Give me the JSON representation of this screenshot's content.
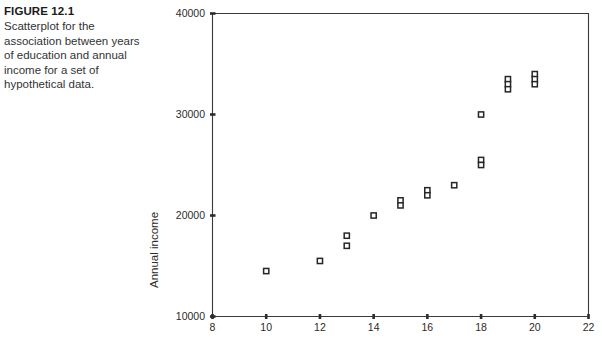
{
  "figure": {
    "number": "FIGURE 12.1",
    "caption": "Scatterplot for the association between years of education and annual income for a set of hypothetical data."
  },
  "chart_data": {
    "type": "scatter",
    "title": "",
    "xlabel": "",
    "ylabel": "Annual income",
    "xlim": [
      8,
      22
    ],
    "ylim": [
      10000,
      40000
    ],
    "xticks": [
      8,
      10,
      12,
      14,
      16,
      18,
      20,
      22
    ],
    "xtick_labels": [
      "8",
      "10",
      "12",
      "14",
      "16",
      "18",
      "20",
      "22"
    ],
    "yticks": [
      10000,
      20000,
      30000,
      40000
    ],
    "ytick_labels": [
      "10000",
      "20000",
      "30000",
      "40000"
    ],
    "grid": false,
    "legend": null,
    "marker": "open-square",
    "marker_color": "#262626",
    "points": [
      {
        "x": 10,
        "y": 14500
      },
      {
        "x": 12,
        "y": 15500
      },
      {
        "x": 13,
        "y": 18000
      },
      {
        "x": 13,
        "y": 17000
      },
      {
        "x": 14,
        "y": 20000
      },
      {
        "x": 15,
        "y": 21500
      },
      {
        "x": 15,
        "y": 21000
      },
      {
        "x": 16,
        "y": 22500
      },
      {
        "x": 16,
        "y": 22000
      },
      {
        "x": 17,
        "y": 23000
      },
      {
        "x": 18,
        "y": 30000
      },
      {
        "x": 18,
        "y": 25500
      },
      {
        "x": 18,
        "y": 25000
      },
      {
        "x": 19,
        "y": 33500
      },
      {
        "x": 19,
        "y": 33000
      },
      {
        "x": 19,
        "y": 32500
      },
      {
        "x": 20,
        "y": 34000
      },
      {
        "x": 20,
        "y": 33500
      },
      {
        "x": 20,
        "y": 33000
      }
    ]
  },
  "colors": {
    "axis": "#3a3a3a",
    "text": "#2b2b2b",
    "marker_stroke": "#262626",
    "background": "#ffffff"
  }
}
